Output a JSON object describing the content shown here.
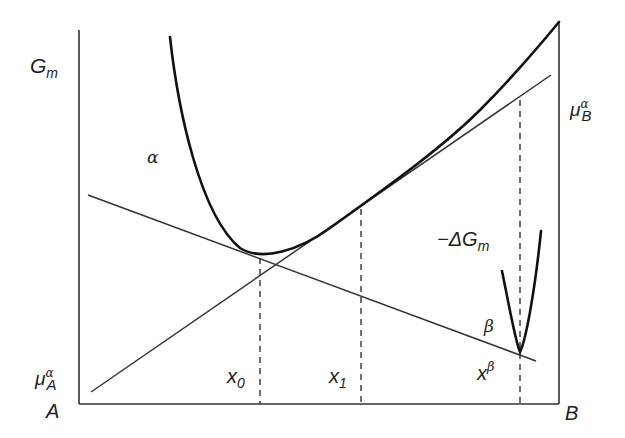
{
  "diagram": {
    "colors": {
      "background": "#ffffff",
      "line": "#1a1a1a",
      "axis": "#333333"
    },
    "axes": {
      "y_label": "G",
      "y_label_sub": "m",
      "x_left_label": "A",
      "x_right_label": "B"
    },
    "labels": {
      "alpha_phase": "α",
      "beta_phase": "β",
      "mu_A": {
        "base": "μ",
        "sup": "α",
        "sub": "A"
      },
      "mu_B": {
        "base": "μ",
        "sup": "α",
        "sub": "B"
      },
      "neg_delta_G": {
        "prefix": "−ΔG",
        "sub": "m"
      },
      "x0": {
        "base": "x",
        "sub": "0"
      },
      "x1": {
        "base": "x",
        "sub": "1"
      },
      "xbeta": {
        "base": "x",
        "sup": "β"
      }
    }
  }
}
